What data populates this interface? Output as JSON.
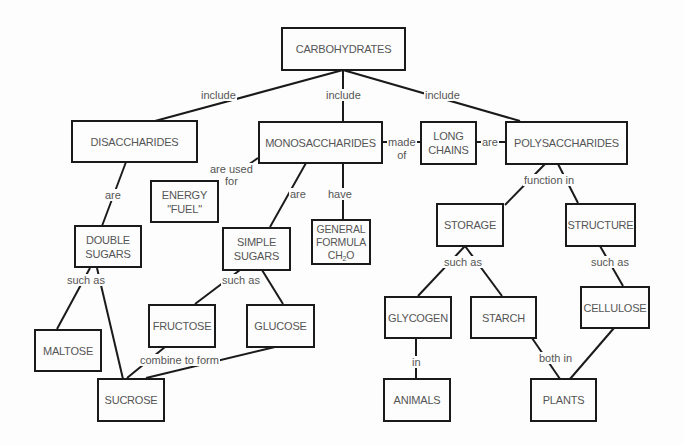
{
  "concept_map": {
    "title": "CARBOHYDRATES",
    "nodes": {
      "carbohydrates": "CARBOHYDRATES",
      "disaccharides": "DISACCHARIDES",
      "monosaccharides": "MONOSACCHARIDES",
      "long_chains": "LONG\nCHAINS",
      "polysaccharides": "POLYSACCHARIDES",
      "energy_fuel": "ENERGY\n\"FUEL\"",
      "double_sugars": "DOUBLE\nSUGARS",
      "simple_sugars": "SIMPLE\nSUGARS",
      "general_formula_line1": "GENERAL\nFORMULA",
      "general_formula_ch": "CH",
      "general_formula_sub": "2",
      "general_formula_o": "O",
      "storage": "STORAGE",
      "structure": "STRUCTURE",
      "fructose": "FRUCTOSE",
      "glucose": "GLUCOSE",
      "maltose": "MALTOSE",
      "sucrose": "SUCROSE",
      "glycogen": "GLYCOGEN",
      "starch": "STARCH",
      "cellulose": "CELLULOSE",
      "animals": "ANIMALS",
      "plants": "PLANTS"
    },
    "links": {
      "include_left": "include",
      "include_mid": "include",
      "include_right": "include",
      "made_of": "made\nof",
      "are_poly": "are",
      "are_used_for": "are used\nfor",
      "are_di": "are",
      "are_mono": "are",
      "have": "have",
      "function_in": "function in",
      "such_as_double": "such as",
      "such_as_simple": "such as",
      "combine_to_form": "combine to form",
      "such_as_storage": "such as",
      "such_as_structure": "such as",
      "in_animals": "in",
      "both_in": "both in"
    }
  }
}
